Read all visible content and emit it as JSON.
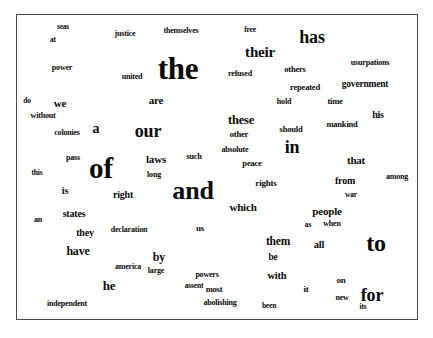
{
  "figure": {
    "type": "word-cloud",
    "title": "",
    "background_color": "#ffffff",
    "text_color": "#0a0a0a",
    "border_color": "#4a4a4a",
    "font_style": "serif-bold",
    "source_text": "Declaration of Independence"
  },
  "chart_data": {
    "type": "table",
    "title": "",
    "xlabel": "",
    "ylabel": "",
    "layout": "word cloud, words sized by frequency, black serif bold text on white background with thin gray rectangular border",
    "categories": [
      "the",
      "of",
      "and",
      "to",
      "for",
      "has",
      "their",
      "our",
      "in",
      "a",
      "we",
      "these",
      "are",
      "he",
      "have",
      "by",
      "which",
      "them",
      "be",
      "with",
      "laws",
      "right",
      "states",
      "they",
      "people",
      "all",
      "that",
      "from",
      "his",
      "us",
      "so",
      "large",
      "on",
      "it",
      "pass",
      "long",
      "such",
      "other",
      "absolute",
      "peace",
      "rights",
      "is",
      "an",
      "this",
      "colonies",
      "without",
      "do",
      "power",
      "at",
      "seas",
      "justice",
      "united",
      "themselves",
      "free",
      "refused",
      "others",
      "repeated",
      "hold",
      "time",
      "usurpations",
      "government",
      "mankind",
      "should",
      "among",
      "war",
      "as",
      "when",
      "new",
      "its",
      "been",
      "most",
      "abolishing",
      "assent",
      "powers",
      "america",
      "declaration",
      "independent"
    ],
    "values": [
      100,
      86,
      84,
      72,
      52,
      50,
      44,
      42,
      42,
      38,
      32,
      30,
      28,
      28,
      26,
      26,
      24,
      24,
      22,
      22,
      22,
      22,
      22,
      20,
      22,
      22,
      22,
      20,
      20,
      18,
      18,
      16,
      16,
      16,
      14,
      14,
      16,
      16,
      14,
      14,
      14,
      18,
      14,
      12,
      12,
      14,
      13,
      13,
      12,
      12,
      13,
      13,
      13,
      12,
      12,
      13,
      12,
      12,
      12,
      12,
      13,
      12,
      12,
      12,
      12,
      11,
      11,
      11,
      10,
      11,
      12,
      11,
      11,
      11,
      11,
      11,
      11
    ]
  },
  "words": [
    {
      "text": "seas",
      "x": 62,
      "y": 26,
      "size": 7.5
    },
    {
      "text": "at",
      "x": 52,
      "y": 39,
      "size": 7.5
    },
    {
      "text": "justice",
      "x": 124,
      "y": 33,
      "size": 8
    },
    {
      "text": "themselves",
      "x": 180,
      "y": 30,
      "size": 8
    },
    {
      "text": "free",
      "x": 249,
      "y": 29,
      "size": 7.5
    },
    {
      "text": "has",
      "x": 311,
      "y": 36,
      "size": 18
    },
    {
      "text": "their",
      "x": 259,
      "y": 51,
      "size": 15
    },
    {
      "text": "the",
      "x": 177,
      "y": 67,
      "size": 31
    },
    {
      "text": "power",
      "x": 61,
      "y": 67,
      "size": 8
    },
    {
      "text": "united",
      "x": 131,
      "y": 76,
      "size": 8
    },
    {
      "text": "refused",
      "x": 239,
      "y": 73,
      "size": 8
    },
    {
      "text": "others",
      "x": 294,
      "y": 68,
      "size": 8.5
    },
    {
      "text": "usurpations",
      "x": 369,
      "y": 62,
      "size": 8
    },
    {
      "text": "government",
      "x": 364,
      "y": 84,
      "size": 9.5
    },
    {
      "text": "repeated",
      "x": 304,
      "y": 86,
      "size": 8.5
    },
    {
      "text": "do",
      "x": 26,
      "y": 100,
      "size": 7.5
    },
    {
      "text": "we",
      "x": 59,
      "y": 102,
      "size": 11
    },
    {
      "text": "are",
      "x": 155,
      "y": 99,
      "size": 11
    },
    {
      "text": "hold",
      "x": 283,
      "y": 101,
      "size": 8
    },
    {
      "text": "time",
      "x": 334,
      "y": 100,
      "size": 8.5
    },
    {
      "text": "without",
      "x": 42,
      "y": 115,
      "size": 8
    },
    {
      "text": "his",
      "x": 377,
      "y": 114,
      "size": 10
    },
    {
      "text": "mankind",
      "x": 341,
      "y": 123,
      "size": 8.5
    },
    {
      "text": "these",
      "x": 240,
      "y": 119,
      "size": 12.5
    },
    {
      "text": "a",
      "x": 95,
      "y": 128,
      "size": 14
    },
    {
      "text": "our",
      "x": 147,
      "y": 130,
      "size": 18
    },
    {
      "text": "colonies",
      "x": 66,
      "y": 132,
      "size": 8
    },
    {
      "text": "should",
      "x": 290,
      "y": 128,
      "size": 8.5
    },
    {
      "text": "other",
      "x": 238,
      "y": 133,
      "size": 8.5
    },
    {
      "text": "in",
      "x": 291,
      "y": 146,
      "size": 18
    },
    {
      "text": "absolute",
      "x": 234,
      "y": 149,
      "size": 8
    },
    {
      "text": "that",
      "x": 355,
      "y": 159,
      "size": 11
    },
    {
      "text": "pass",
      "x": 72,
      "y": 157,
      "size": 8
    },
    {
      "text": "this",
      "x": 36,
      "y": 172,
      "size": 7.5
    },
    {
      "text": "of",
      "x": 100,
      "y": 167,
      "size": 29
    },
    {
      "text": "laws",
      "x": 155,
      "y": 158,
      "size": 11
    },
    {
      "text": "such",
      "x": 193,
      "y": 155,
      "size": 8.5
    },
    {
      "text": "peace",
      "x": 251,
      "y": 162,
      "size": 8.5
    },
    {
      "text": "long",
      "x": 153,
      "y": 174,
      "size": 8
    },
    {
      "text": "from",
      "x": 344,
      "y": 180,
      "size": 10
    },
    {
      "text": "among",
      "x": 396,
      "y": 176,
      "size": 8
    },
    {
      "text": "rights",
      "x": 265,
      "y": 182,
      "size": 9
    },
    {
      "text": "is",
      "x": 64,
      "y": 190,
      "size": 10
    },
    {
      "text": "right",
      "x": 122,
      "y": 194,
      "size": 10
    },
    {
      "text": "and",
      "x": 192,
      "y": 190,
      "size": 26
    },
    {
      "text": "war",
      "x": 350,
      "y": 194,
      "size": 7.5
    },
    {
      "text": "which",
      "x": 242,
      "y": 206,
      "size": 11
    },
    {
      "text": "people",
      "x": 326,
      "y": 210,
      "size": 11
    },
    {
      "text": "an",
      "x": 37,
      "y": 219,
      "size": 8
    },
    {
      "text": "states",
      "x": 73,
      "y": 213,
      "size": 10
    },
    {
      "text": "as",
      "x": 307,
      "y": 224,
      "size": 7.5
    },
    {
      "text": "when",
      "x": 331,
      "y": 223,
      "size": 8
    },
    {
      "text": "us",
      "x": 199,
      "y": 227,
      "size": 9
    },
    {
      "text": "they",
      "x": 84,
      "y": 232,
      "size": 10
    },
    {
      "text": "declaration",
      "x": 128,
      "y": 229,
      "size": 8
    },
    {
      "text": "them",
      "x": 277,
      "y": 241,
      "size": 11.5
    },
    {
      "text": "all",
      "x": 318,
      "y": 244,
      "size": 10.5
    },
    {
      "text": "to",
      "x": 375,
      "y": 242,
      "size": 24
    },
    {
      "text": "have",
      "x": 77,
      "y": 250,
      "size": 12
    },
    {
      "text": "by",
      "x": 158,
      "y": 256,
      "size": 12
    },
    {
      "text": "be",
      "x": 272,
      "y": 257,
      "size": 9.5
    },
    {
      "text": "america",
      "x": 127,
      "y": 266,
      "size": 8
    },
    {
      "text": "large",
      "x": 155,
      "y": 270,
      "size": 8
    },
    {
      "text": "powers",
      "x": 206,
      "y": 274,
      "size": 8
    },
    {
      "text": "with",
      "x": 276,
      "y": 275,
      "size": 10.5
    },
    {
      "text": "he",
      "x": 108,
      "y": 284,
      "size": 13
    },
    {
      "text": "on",
      "x": 340,
      "y": 279,
      "size": 9
    },
    {
      "text": "most",
      "x": 213,
      "y": 288,
      "size": 8.5
    },
    {
      "text": "it",
      "x": 305,
      "y": 288,
      "size": 9
    },
    {
      "text": "assent",
      "x": 193,
      "y": 285,
      "size": 7.5
    },
    {
      "text": "for",
      "x": 371,
      "y": 294,
      "size": 18
    },
    {
      "text": "new",
      "x": 341,
      "y": 297,
      "size": 8
    },
    {
      "text": "independent",
      "x": 66,
      "y": 303,
      "size": 8
    },
    {
      "text": "abolishing",
      "x": 219,
      "y": 302,
      "size": 8
    },
    {
      "text": "been",
      "x": 268,
      "y": 305,
      "size": 7.5
    },
    {
      "text": "its",
      "x": 362,
      "y": 306,
      "size": 7.5
    }
  ]
}
